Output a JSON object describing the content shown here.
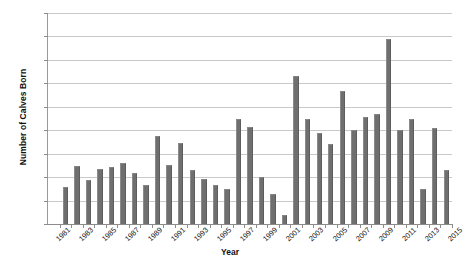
{
  "chart_data": {
    "type": "bar",
    "title": "",
    "xlabel": "Year",
    "ylabel": "Number of Calves Born",
    "ylim": [
      0,
      45
    ],
    "ytick_step": 5,
    "yticks": [
      0,
      5,
      10,
      15,
      20,
      25,
      30,
      35,
      40,
      45
    ],
    "xlim": [
      1980,
      2015
    ],
    "xticks_labeled": [
      1981,
      1983,
      1985,
      1987,
      1989,
      1991,
      1993,
      1995,
      1997,
      1999,
      2001,
      2003,
      2005,
      2007,
      2009,
      2011,
      2013,
      2015
    ],
    "xtick_label_step": 2,
    "grid": "horizontal",
    "legend": "none",
    "bar_color": "#6f6f6f",
    "categories": [
      1981,
      1982,
      1983,
      1984,
      1985,
      1986,
      1987,
      1988,
      1989,
      1990,
      1991,
      1992,
      1993,
      1994,
      1995,
      1996,
      1997,
      1998,
      1999,
      2000,
      2001,
      2002,
      2003,
      2004,
      2005,
      2006,
      2007,
      2008,
      2009,
      2010,
      2011,
      2012,
      2013,
      2014
    ],
    "values": [
      8,
      12.3,
      9.3,
      11.8,
      12.1,
      13,
      10.8,
      8.3,
      18.7,
      12.5,
      17.2,
      11.5,
      9.7,
      8.3,
      7.5,
      22.5,
      20.7,
      10,
      6.5,
      2,
      31.5,
      22.3,
      19.5,
      17,
      28.3,
      20,
      22.8,
      23.5,
      39.5,
      20,
      22.5,
      7.5,
      20.5,
      11.5
    ]
  },
  "axes": {
    "y_title": "Number of Calves Born",
    "x_title": "Year"
  }
}
